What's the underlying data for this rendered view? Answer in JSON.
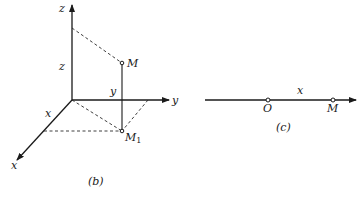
{
  "figure_b": {
    "caption": "(b)",
    "axes": {
      "z_label": "z",
      "y_label": "y",
      "x_label": "x"
    },
    "projection_labels": {
      "z": "z",
      "y": "y",
      "x": "x"
    },
    "points": {
      "M": "M",
      "M1_base": "M",
      "M1_sub": "1"
    }
  },
  "figure_c": {
    "caption": "(c)",
    "segment_label": "x",
    "points": {
      "O": "O",
      "M": "M"
    }
  },
  "colors": {
    "ink": "#1a1a1a",
    "background": "#ffffff"
  }
}
